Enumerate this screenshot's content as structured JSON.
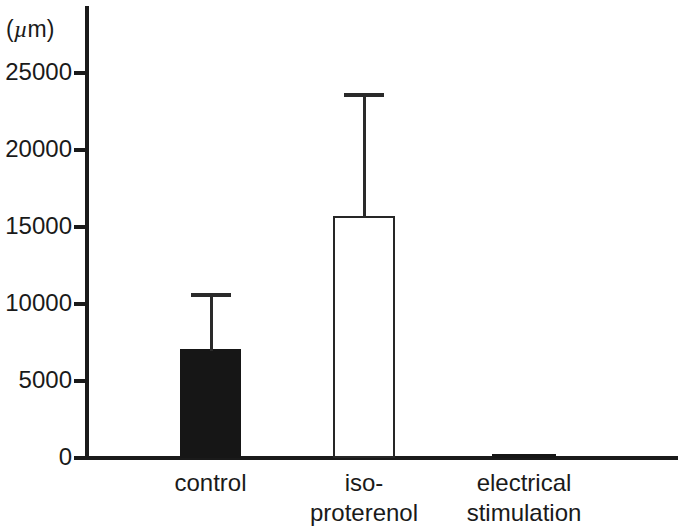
{
  "chart_data": {
    "type": "bar",
    "title": "",
    "subtitle": "",
    "xlabel": "",
    "ylabel": "(µm)",
    "ylabel_parts": {
      "open_paren": "(",
      "mu": "µ",
      "rest": "m)"
    },
    "categories": [
      "control",
      "iso-proterenol",
      "electrical stimulation"
    ],
    "category_lines": [
      [
        "control"
      ],
      [
        "iso-",
        "proterenol"
      ],
      [
        "electrical",
        "stimulation"
      ]
    ],
    "values": [
      7100,
      15700,
      250
    ],
    "errors_upper": [
      3600,
      8000,
      0
    ],
    "error_tops": [
      10700,
      23700,
      250
    ],
    "bar_styles": [
      "filled",
      "open",
      "filled"
    ],
    "ylim": [
      0,
      26500
    ],
    "yticks": [
      0,
      5000,
      10000,
      15000,
      20000,
      25000
    ],
    "ytick_labels": [
      "0",
      "5000",
      "10000",
      "15000",
      "20000",
      "25000"
    ],
    "grid": false,
    "legend": null,
    "colors": {
      "filled_bar": "#161616",
      "open_bar_fill": "#ffffff",
      "open_bar_stroke": "#262626",
      "axis": "#1a1a1a",
      "error_bar": "#2a2a2a",
      "background": "#ffffff"
    }
  },
  "axis": {
    "unit_caption": "(µm)",
    "tick_labels": [
      "25000",
      "20000",
      "15000",
      "10000",
      "5000",
      "0"
    ]
  },
  "bars": [
    {
      "name": "control",
      "label_lines": [
        "control"
      ],
      "value": 7100,
      "error_top": 10700,
      "style": "filled"
    },
    {
      "name": "iso-proterenol",
      "label_lines": [
        "iso-",
        "proterenol"
      ],
      "value": 15700,
      "error_top": 23700,
      "style": "open"
    },
    {
      "name": "electrical-stim",
      "label_lines": [
        "electrical",
        "stimulation"
      ],
      "value": 250,
      "error_top": 250,
      "style": "filled"
    }
  ]
}
